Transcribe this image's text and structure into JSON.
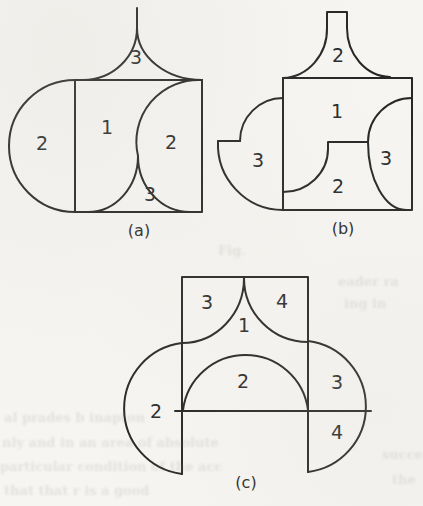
{
  "page": {
    "kind": "scanned-book-figure",
    "background_color": "#f6f5f2",
    "ink_color": "#262626"
  },
  "figure": {
    "panels": [
      {
        "id": "a",
        "caption": {
          "t": "(a)",
          "x": 139,
          "y": 230
        },
        "labels": [
          {
            "t": "3",
            "x": 136,
            "y": 57
          },
          {
            "t": "2",
            "x": 42,
            "y": 143
          },
          {
            "t": "1",
            "x": 107,
            "y": 127
          },
          {
            "t": "2",
            "x": 171,
            "y": 142
          },
          {
            "t": "3",
            "x": 150,
            "y": 194
          }
        ]
      },
      {
        "id": "b",
        "caption": {
          "t": "(b)",
          "x": 343,
          "y": 228
        },
        "labels": [
          {
            "t": "2",
            "x": 338,
            "y": 55
          },
          {
            "t": "1",
            "x": 337,
            "y": 111
          },
          {
            "t": "3",
            "x": 258,
            "y": 160
          },
          {
            "t": "3",
            "x": 386,
            "y": 158
          },
          {
            "t": "2",
            "x": 338,
            "y": 186
          }
        ]
      },
      {
        "id": "c",
        "caption": {
          "t": "(c)",
          "x": 246,
          "y": 482
        },
        "labels": [
          {
            "t": "3",
            "x": 207,
            "y": 302
          },
          {
            "t": "4",
            "x": 282,
            "y": 301
          },
          {
            "t": "1",
            "x": 244,
            "y": 325
          },
          {
            "t": "2",
            "x": 243,
            "y": 381
          },
          {
            "t": "2",
            "x": 156,
            "y": 411
          },
          {
            "t": "3",
            "x": 337,
            "y": 382
          },
          {
            "t": "4",
            "x": 337,
            "y": 432
          }
        ]
      }
    ]
  },
  "ghost_text": [
    {
      "t": "Fig.",
      "x": 218,
      "y": 250
    },
    {
      "t": "eader ra",
      "x": 338,
      "y": 281
    },
    {
      "t": "ing in",
      "x": 344,
      "y": 303
    },
    {
      "t": "al prades b inapton",
      "x": 4,
      "y": 417
    },
    {
      "t": "nly and in an area of absolute",
      "x": 2,
      "y": 442
    },
    {
      "t": "particular condition of the acc",
      "x": 0,
      "y": 466
    },
    {
      "t": "that that r is a good",
      "x": 4,
      "y": 490
    },
    {
      "t": "succe",
      "x": 382,
      "y": 454
    },
    {
      "t": "the",
      "x": 392,
      "y": 479
    }
  ]
}
